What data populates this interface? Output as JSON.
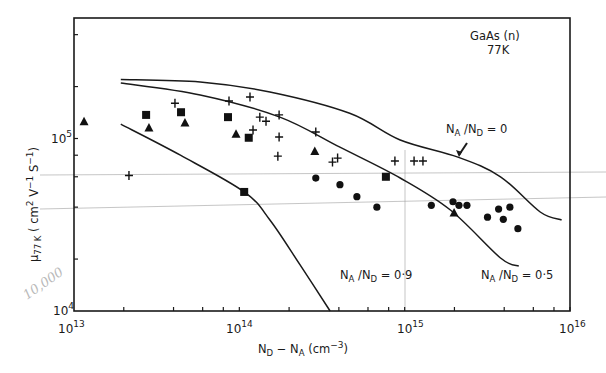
{
  "chart_data": {
    "type": "scatter",
    "title": "",
    "annotation_title": [
      "GaAs (n)",
      "77K"
    ],
    "xlabel": "N_D − N_A (cm^-3)",
    "ylabel": "μ_77K (cm^2 V^-1 S^-1)",
    "xscale": "log",
    "yscale": "log",
    "xlim": [
      10000000000000.0,
      1e+16
    ],
    "ylim": [
      10000.0,
      500000.0
    ],
    "grid": false,
    "x_ticks": [
      {
        "base": "10",
        "exp": "13",
        "value": 10000000000000.0
      },
      {
        "base": "10",
        "exp": "14",
        "value": 100000000000000.0
      },
      {
        "base": "10",
        "exp": "15",
        "value": 1000000000000000.0
      },
      {
        "base": "10",
        "exp": "16",
        "value": 1e+16
      }
    ],
    "y_ticks": [
      {
        "base": "10",
        "exp": "4",
        "value": 10000.0
      },
      {
        "base": "10",
        "exp": "5",
        "value": 100000.0
      }
    ],
    "handwritten_note": "10,000",
    "curves": [
      {
        "name": "N_A/N_D = 0",
        "label_main": "N",
        "label_sub1": "A",
        "label_mid": " /N",
        "label_sub2": "D",
        "label_end": " = 0",
        "x": [
          19200000000000.0,
          58000000000000.0,
          153000000000000.0,
          465000000000000.0,
          940000000000000.0,
          2100000000000000.0,
          3800000000000000.0,
          6600000000000000.0,
          8900000000000000.0
        ],
        "y": [
          220000.0,
          213000.0,
          186000.0,
          140000.0,
          98000.0,
          78000.0,
          60000.0,
          37500.0,
          33700.0
        ]
      },
      {
        "name": "N_A/N_D = 0.5",
        "label_main": "N",
        "label_sub1": "A",
        "label_mid": " /N",
        "label_sub2": "D",
        "label_end": " = 0·5",
        "x": [
          19200000000000.0,
          58000000000000.0,
          176000000000000.0,
          406000000000000.0,
          940000000000000.0,
          1890000000000000.0,
          3800000000000000.0,
          4900000000000000.0
        ],
        "y": [
          210000.0,
          179000.0,
          133000.0,
          89000.0,
          59000.0,
          38500.0,
          20300.0,
          18200.0
        ]
      },
      {
        "name": "N_A/N_D = 0.9",
        "label_main": "N",
        "label_sub1": "A",
        "label_mid": " /N",
        "label_sub2": "D",
        "label_end": " = 0·9",
        "x": [
          19200000000000.0,
          44000000000000.0,
          107000000000000.0,
          153000000000000.0,
          233000000000000.0,
          354000000000000.0
        ],
        "y": [
          121000.0,
          80000.0,
          49000.0,
          33700.0,
          18500.0,
          10000.0
        ]
      }
    ],
    "series": [
      {
        "name": "triangles",
        "marker": "triangle",
        "x": [
          11500000000000.0,
          28400000000000.0,
          46900000000000.0,
          95500000000000.0,
          286000000000000.0,
          1990000000000000.0
        ],
        "y": [
          125000.0,
          115000.0,
          123000.0,
          106000.0,
          84000.0,
          37000.0
        ]
      },
      {
        "name": "squares",
        "marker": "square",
        "x": [
          27300000000000.0,
          44400000000000.0,
          85400000000000.0,
          114000000000000.0,
          107000000000000.0,
          770000000000000.0
        ],
        "y": [
          137000.0,
          142000.0,
          133000.0,
          101000.0,
          49000.0,
          60000.0
        ]
      },
      {
        "name": "crosses",
        "marker": "plus",
        "x": [
          21500000000000.0,
          40800000000000.0,
          86600000000000.0,
          116000000000000.0,
          121000000000000.0,
          133000000000000.0,
          145000000000000.0,
          174000000000000.0,
          174000000000000.0,
          171000000000000.0,
          290000000000000.0,
          366000000000000.0,
          393000000000000.0,
          873000000000000.0,
          1140000000000000.0,
          1290000000000000.0
        ],
        "y": [
          61000.0,
          160000.0,
          165000.0,
          174000.0,
          112000.0,
          133000.0,
          126000.0,
          137000.0,
          102000.0,
          79000.0,
          109000.0,
          73000.0,
          77000.0,
          74000.0,
          74000.0,
          74000.0
        ]
      },
      {
        "name": "circles",
        "marker": "circle",
        "x": [
          290000000000000.0,
          406000000000000.0,
          514000000000000.0,
          679000000000000.0,
          1450000000000000.0,
          1960000000000000.0,
          2130000000000000.0,
          2380000000000000.0,
          3170000000000000.0,
          3700000000000000.0,
          3950000000000000.0,
          4330000000000000.0,
          4840000000000000.0
        ],
        "y": [
          59000.0,
          54000.0,
          46000.0,
          40000.0,
          41000.0,
          43000.0,
          41000.0,
          41000.0,
          35000.0,
          39000.0,
          34000.0,
          40000.0,
          30000.0
        ]
      }
    ]
  }
}
